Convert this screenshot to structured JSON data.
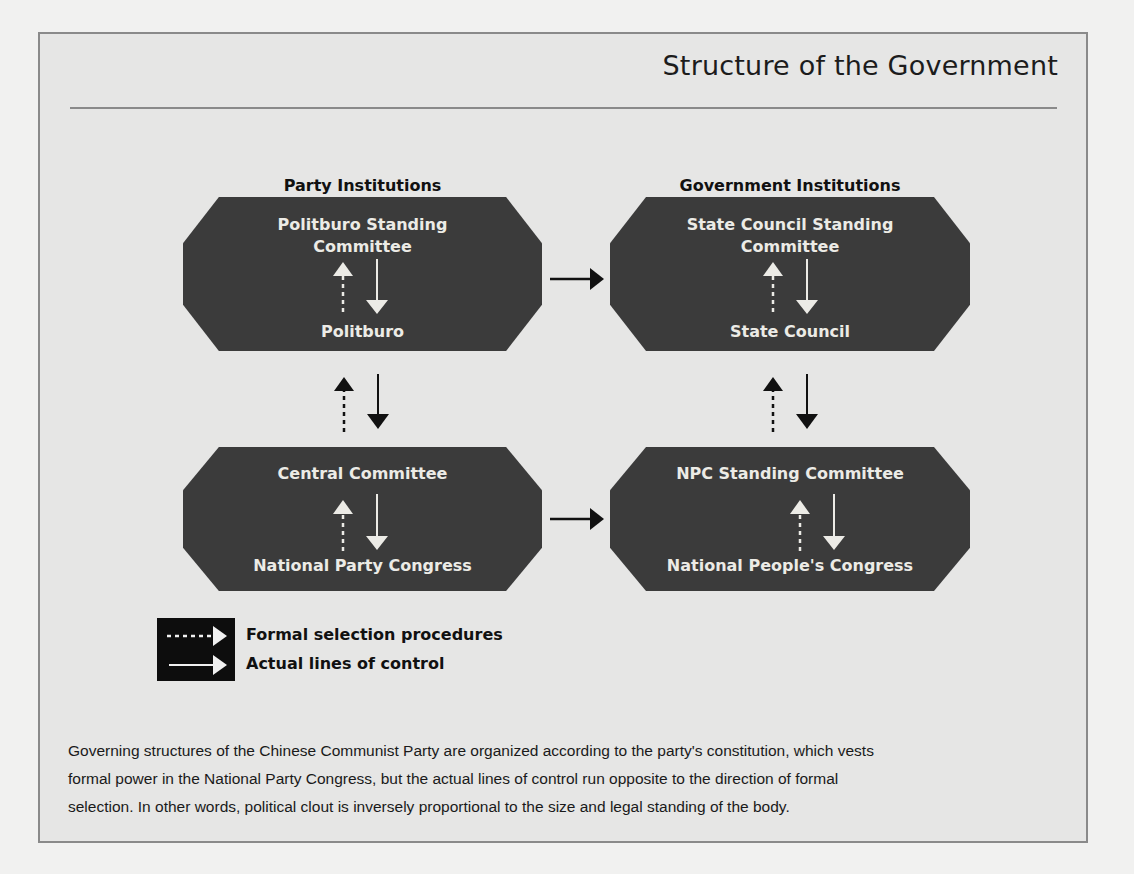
{
  "figure": {
    "title": "Structure of the Government",
    "columns": {
      "party": "Party Institutions",
      "government": "Government Institutions"
    },
    "boxes": {
      "party_top": {
        "upper": "Politburo Standing Committee",
        "upper_line1": "Politburo Standing",
        "upper_line2": "Committee",
        "lower": "Politburo"
      },
      "gov_top": {
        "upper": "State Council Standing Committee",
        "upper_line1": "State Council Standing",
        "upper_line2": "Committee",
        "lower": "State Council"
      },
      "party_bottom": {
        "upper": "Central Committee",
        "lower": "National Party Congress"
      },
      "gov_bottom": {
        "upper": "NPC Standing Committee",
        "lower": "National People's Congress"
      }
    },
    "legend": {
      "formal": "Formal selection procedures",
      "actual": "Actual lines of control"
    },
    "caption": "Governing structures of the Chinese Communist Party are organized according to the party's constitution, which vests formal power in the National Party Congress, but the actual lines of control run opposite to the direction of formal selection. In other words, political clout is inversely proportional to the size and legal standing of the body.",
    "caption_lines": [
      "Governing structures of the Chinese Communist Party are organized according to the party's constitution, which vests",
      "formal power in the National Party Congress, but the actual lines of control run opposite to the direction of formal",
      "selection. In other words, political clout is inversely proportional to the size and legal standing of the body."
    ],
    "colors": {
      "box_fill": "#3b3b3b",
      "box_text": "#ecebe6",
      "frame_bg": "#e6e6e5",
      "frame_border": "#8a8a8a",
      "legend_bg": "#0d0d0d"
    }
  }
}
